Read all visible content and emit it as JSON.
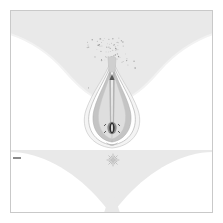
{
  "image": {
    "title": "Anatomical line illustration",
    "subject": "external female genital anatomy, frontal view",
    "width": 223,
    "height": 223,
    "background_color": "#ffffff",
    "style": "medical line drawing with stipple shading"
  },
  "frame": {
    "name": "border-frame",
    "visible": true,
    "inset": 10,
    "stroke_color": "#c9c9c9",
    "stroke_width": 1,
    "fill": "#ffffff"
  },
  "regions": {
    "thigh_wedge": {
      "label": "inner thigh wedge",
      "position": "top",
      "fill_color": "#e9e9e9",
      "description": "light grey V shaped wedge converging downward from the top edge"
    },
    "lower_band": {
      "label": "lower body band",
      "position": "bottom",
      "fill_color": "#e9e9e9",
      "description": "light grey band across the bottom with two white rounded lobes"
    },
    "lobe_left": {
      "label": "left rounded lobe",
      "fill_color": "#ffffff"
    },
    "lobe_right": {
      "label": "right rounded lobe",
      "fill_color": "#ffffff"
    }
  },
  "figure": {
    "center_structure": {
      "label": "central teardrop structure",
      "center_x": 112,
      "top_y": 60,
      "bottom_y": 148,
      "outer_outline_color": "#b5b5b5",
      "mid_fill_color": "#c4c4c4",
      "inner_fill_color": "#d8d8d8",
      "core_color": "#9a9a9a"
    },
    "apex_mark": {
      "label": "upper apex mark",
      "x": 112,
      "y": 78,
      "color": "#555555"
    },
    "lower_detail": {
      "label": "lower central detail",
      "x": 112,
      "y": 128,
      "color": "#2e2e2e"
    },
    "stipple": {
      "label": "stipple shading field",
      "dot_color": "#8f8f8f",
      "dot_count": 520,
      "region": "above and around the central structure"
    },
    "starburst": {
      "label": "starburst marker",
      "x": 113,
      "y": 160,
      "color": "#b0b0b0",
      "rays": 16
    },
    "left_tick": {
      "label": "left tick dash",
      "x": 16,
      "y": 158,
      "width": 8,
      "height": 2,
      "color": "#8a8a8a"
    }
  },
  "palette": {
    "white": "#ffffff",
    "light_grey": "#e9e9e9",
    "mid_grey": "#c4c4c4",
    "outline_grey": "#b5b5b5",
    "dark_grey": "#555555",
    "near_black": "#2e2e2e",
    "frame_grey": "#c9c9c9"
  }
}
